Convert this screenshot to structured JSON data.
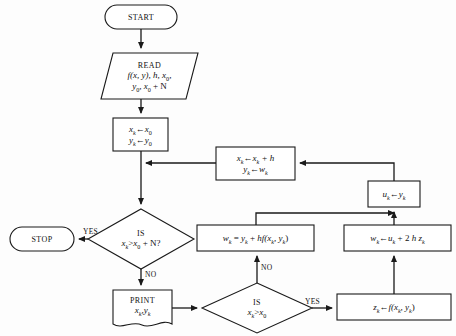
{
  "diagram": {
    "background_color": "#fdfdfd",
    "stroke_color": "#1a1a1a",
    "fill_color": "#ffffff"
  },
  "nodes": {
    "start": {
      "shape": "terminator",
      "label": "START"
    },
    "read": {
      "shape": "parallelogram",
      "label": "READ",
      "line1": "f(x, y), h, x",
      "line1_sub": "0",
      "line1_tail": ",",
      "line2_a": "y",
      "line2_a_sub": "0",
      "line2_b": ", x",
      "line2_b_sub": "0",
      "line2_c": " + N"
    },
    "init": {
      "shape": "process",
      "line1_lhs": "x",
      "line1_lhs_sub": "k",
      "line1_arrow": "←",
      "line1_rhs": "x",
      "line1_rhs_sub": "0",
      "line2_lhs": "y",
      "line2_lhs_sub": "k",
      "line2_arrow": "←",
      "line2_rhs": "y",
      "line2_rhs_sub": "0"
    },
    "advance": {
      "shape": "process",
      "line1_lhs": "x",
      "line1_lhs_sub": "k",
      "line1_arrow": "←",
      "line1_rhs": "x",
      "line1_rhs_sub": "k",
      "line1_tail": " + h",
      "line2_lhs": "y",
      "line2_lhs_sub": "k",
      "line2_arrow": "←",
      "line2_rhs": "w",
      "line2_rhs_sub": "k"
    },
    "u_assign": {
      "shape": "process",
      "lhs": "u",
      "lhs_sub": "k",
      "arrow": "←",
      "rhs": "y",
      "rhs_sub": "k"
    },
    "decision_main": {
      "shape": "diamond",
      "line1": "IS",
      "line2_a": "x",
      "line2_a_sub": "k",
      "line2_op": ">",
      "line2_b": "x",
      "line2_b_sub": "0",
      "line2_tail": " + N?"
    },
    "stop": {
      "shape": "terminator",
      "label": "STOP"
    },
    "print": {
      "shape": "document",
      "label": "PRINT",
      "line2_a": "x",
      "line2_a_sub": "k",
      "line2_sep": ",",
      "line2_b": "y",
      "line2_b_sub": "k"
    },
    "decision_first": {
      "shape": "diamond",
      "line1": "IS",
      "line2_a": "x",
      "line2_a_sub": "k",
      "line2_op": ">",
      "line2_b": "x",
      "line2_b_sub": "0"
    },
    "euler": {
      "shape": "process",
      "lhs": "w",
      "lhs_sub": "k",
      "eq": " = ",
      "rhs_a": "y",
      "rhs_a_sub": "k",
      "plus": " + ",
      "rhs_b": "h",
      "fn": "f(x",
      "fn_sub1": "k",
      "fn_mid": ", y",
      "fn_sub2": "k",
      "fn_close": ")"
    },
    "midpoint": {
      "shape": "process",
      "lhs": "w",
      "lhs_sub": "k",
      "arrow": "←",
      "rhs_a": "u",
      "rhs_a_sub": "k",
      "plus": " + 2 ",
      "h": "h",
      "z": " z",
      "z_sub": "k"
    },
    "slope": {
      "shape": "process",
      "lhs": "z",
      "lhs_sub": "k",
      "arrow": "←",
      "fn": "f(x",
      "fn_sub1": "k",
      "fn_mid": ", y",
      "fn_sub2": "k",
      "fn_close": ")"
    }
  },
  "edge_labels": {
    "yes_stop": "YES",
    "no_print": "NO",
    "no_euler": "NO",
    "yes_slope": "YES"
  }
}
